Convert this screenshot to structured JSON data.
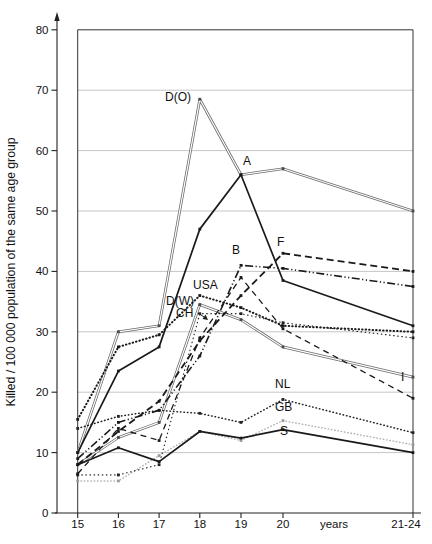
{
  "chart_data": {
    "type": "line",
    "title": "",
    "ylabel": "Killed / 100 000 population of the same age group",
    "xlabel": "years",
    "categories": [
      "15",
      "16",
      "17",
      "18",
      "19",
      "20",
      "21-24"
    ],
    "x_unit_label": "years",
    "ylim": [
      0,
      80
    ],
    "y_major_step": 10,
    "y_tick_labels": [
      "0",
      "10",
      "20",
      "30",
      "40",
      "50",
      "60",
      "70",
      "80"
    ],
    "grid": "horizontal",
    "legend_position": "inline-labels",
    "series": [
      {
        "name": "D(O)",
        "style": "double",
        "color": "#6a6a6a",
        "marker_color": "#4a4a4a",
        "values": [
          10,
          30,
          31,
          68.5,
          56,
          57,
          50
        ],
        "label_pos": [
          165,
          101
        ],
        "label_anchor": "start"
      },
      {
        "name": "D(W)",
        "style": "double",
        "color": "#6a6a6a",
        "marker_color": "#4a4a4a",
        "values": [
          8,
          12.5,
          15,
          34.5,
          32,
          27.5,
          22.5
        ],
        "label_pos": [
          166,
          305
        ],
        "label_anchor": "start"
      },
      {
        "name": "GB",
        "style": "dotted-light",
        "color": "#b0b0b0",
        "marker_color": "#9a9a9a",
        "values": [
          5.3,
          5.3,
          9.5,
          13.5,
          12,
          15.3,
          11.3
        ],
        "label_pos": [
          275,
          411
        ],
        "label_anchor": "start"
      },
      {
        "name": "CH",
        "style": "dotted-fine",
        "color": "#222222",
        "marker_color": "#222222",
        "values": [
          6.3,
          6.3,
          8,
          33,
          33,
          31.5,
          29
        ],
        "label_pos": [
          176,
          317
        ],
        "label_anchor": "start"
      },
      {
        "name": "NL",
        "style": "dotted",
        "color": "#222222",
        "marker_color": "#222222",
        "values": [
          14,
          16,
          17,
          16.5,
          15,
          18.8,
          13.3
        ],
        "label_pos": [
          275,
          388
        ],
        "label_anchor": "start"
      },
      {
        "name": "USA",
        "style": "dotted-bold",
        "color": "#1a1a1a",
        "marker_color": "#1a1a1a",
        "values": [
          15.5,
          27.5,
          29.5,
          36,
          34,
          31,
          30
        ],
        "label_pos": [
          193,
          289
        ],
        "label_anchor": "start"
      },
      {
        "name": "I",
        "style": "dashed",
        "color": "#1a1a1a",
        "marker_color": "#1a1a1a",
        "values": [
          6.5,
          14,
          12,
          29,
          39,
          30.5,
          19
        ],
        "label_pos": [
          401,
          381
        ],
        "label_anchor": "start"
      },
      {
        "name": "B",
        "style": "dashdotdot",
        "color": "#1a1a1a",
        "marker_color": "#1a1a1a",
        "values": [
          9,
          15,
          17,
          26,
          41,
          40.5,
          37.5
        ],
        "label_pos": [
          232,
          254
        ],
        "label_anchor": "start"
      },
      {
        "name": "F",
        "style": "dashed-bold",
        "color": "#1a1a1a",
        "marker_color": "#1a1a1a",
        "values": [
          8,
          13.5,
          18.5,
          28.5,
          36,
          43,
          40
        ],
        "label_pos": [
          277,
          246
        ],
        "label_anchor": "start"
      },
      {
        "name": "S",
        "style": "solid",
        "color": "#1a1a1a",
        "marker_color": "#1a1a1a",
        "values": [
          8,
          10.8,
          8.5,
          13.5,
          12.4,
          13.8,
          10
        ],
        "label_pos": [
          280,
          435
        ],
        "label_anchor": "start"
      },
      {
        "name": "A",
        "style": "solid",
        "color": "#1a1a1a",
        "marker_color": "#1a1a1a",
        "values": [
          10,
          23.5,
          27.5,
          47,
          56,
          38.5,
          31
        ],
        "label_pos": [
          243,
          165
        ],
        "label_anchor": "start"
      }
    ]
  }
}
